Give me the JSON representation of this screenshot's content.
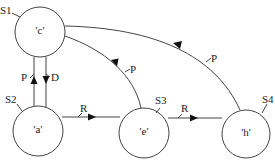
{
  "diagram": {
    "type": "state-transition",
    "nodes": [
      {
        "id": "S1",
        "tag": "S1",
        "label": "'c'"
      },
      {
        "id": "S2",
        "tag": "S2",
        "label": "'a'"
      },
      {
        "id": "S3",
        "tag": "S3",
        "label": "'e'"
      },
      {
        "id": "S4",
        "tag": "S4",
        "label": "'h'"
      }
    ],
    "edges": [
      {
        "from": "S2",
        "to": "S1",
        "label": "P"
      },
      {
        "from": "S1",
        "to": "S2",
        "label": "D"
      },
      {
        "from": "S2",
        "to": "S3",
        "label": "R"
      },
      {
        "from": "S3",
        "to": "S4",
        "label": "R"
      },
      {
        "from": "S3",
        "to": "S1",
        "label": "P"
      },
      {
        "from": "S4",
        "to": "S1",
        "label": "P"
      }
    ]
  }
}
